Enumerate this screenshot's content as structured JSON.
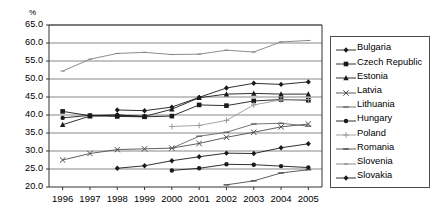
{
  "chart_data": {
    "type": "line",
    "title": "",
    "subtitle": "",
    "xlabel": "",
    "ylabel": "%",
    "x": [
      1996,
      1997,
      1998,
      1999,
      2000,
      2001,
      2002,
      2003,
      2004,
      2005
    ],
    "categories": [
      "1996",
      "1997",
      "1998",
      "1999",
      "2000",
      "2001",
      "2002",
      "2003",
      "2004",
      "2005"
    ],
    "ylim": [
      20.0,
      65.0
    ],
    "yticks": [
      "20.0",
      "25.0",
      "30.0",
      "35.0",
      "40.0",
      "45.0",
      "50.0",
      "55.0",
      "60.0",
      "65.0"
    ],
    "grid": true,
    "legend_position": "right",
    "series": [
      {
        "name": "Bulgaria",
        "marker": "diamond",
        "color": "#1a1a1a",
        "values": [
          null,
          null,
          25.2,
          25.9,
          27.3,
          28.4,
          29.4,
          29.3,
          30.9,
          32.0
        ]
      },
      {
        "name": "Czech Republic",
        "marker": "square",
        "color": "#1a1a1a",
        "values": [
          41.0,
          39.8,
          39.6,
          39.5,
          39.7,
          42.8,
          42.6,
          43.9,
          44.3,
          44.1
        ]
      },
      {
        "name": "Estonia",
        "marker": "triangle",
        "color": "#1a1a1a",
        "values": [
          37.3,
          39.7,
          40.0,
          39.6,
          41.6,
          44.8,
          45.8,
          46.0,
          45.8,
          45.8
        ]
      },
      {
        "name": "Latvia",
        "marker": "x",
        "color": "#4d4d4d",
        "values": [
          27.5,
          29.3,
          30.4,
          30.6,
          30.8,
          32.1,
          33.8,
          35.2,
          36.7,
          37.5
        ]
      },
      {
        "name": "Lithuania",
        "marker": "dash",
        "color": "#666666",
        "values": [
          null,
          null,
          null,
          null,
          30.8,
          34.1,
          35.2,
          37.5,
          37.7,
          36.9
        ]
      },
      {
        "name": "Hungary",
        "marker": "circle",
        "color": "#1a1a1a",
        "values": [
          39.2,
          39.9,
          40.0,
          39.6,
          24.6,
          25.2,
          26.3,
          26.2,
          25.8,
          25.4
        ]
      },
      {
        "name": "Poland",
        "marker": "plus",
        "color": "#9a9a9a",
        "values": [
          null,
          null,
          null,
          null,
          36.8,
          37.1,
          38.5,
          42.8,
          44.2,
          44.3
        ]
      },
      {
        "name": "Romania",
        "marker": "dash",
        "color": "#4d4d4d",
        "values": [
          null,
          null,
          null,
          null,
          null,
          null,
          20.6,
          21.7,
          23.9,
          24.8
        ]
      },
      {
        "name": "Slovenia",
        "marker": "line",
        "color": "#808080",
        "values": [
          52.2,
          55.5,
          57.1,
          57.4,
          56.8,
          56.9,
          58.0,
          57.5,
          60.3,
          60.7
        ]
      },
      {
        "name": "Slovakia",
        "marker": "diamond",
        "color": "#1a1a1a",
        "values": [
          null,
          null,
          41.4,
          41.2,
          42.2,
          44.9,
          47.5,
          48.8,
          48.5,
          49.2
        ]
      }
    ]
  },
  "legend": {
    "items": [
      {
        "label": "Bulgaria"
      },
      {
        "label": "Czech Republic"
      },
      {
        "label": "Estonia"
      },
      {
        "label": "Latvia"
      },
      {
        "label": "Lithuania"
      },
      {
        "label": "Hungary"
      },
      {
        "label": "Poland"
      },
      {
        "label": "Romania"
      },
      {
        "label": "Slovenia"
      },
      {
        "label": "Slovakia"
      }
    ]
  }
}
